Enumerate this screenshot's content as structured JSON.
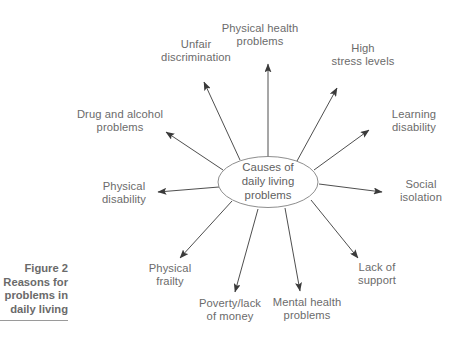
{
  "figure": {
    "caption_lines": [
      "Figure 2",
      "Reasons for",
      "problems in",
      "daily living"
    ],
    "caption_text": "Figure 2 Reasons for problems in daily living"
  },
  "diagram": {
    "center": {
      "label": "Causes of\ndaily living\nproblems"
    },
    "nodes": [
      {
        "id": "physical-health-problems",
        "label": "Physical health\nproblems"
      },
      {
        "id": "high-stress-levels",
        "label": "High\nstress levels"
      },
      {
        "id": "learning-disability",
        "label": "Learning\ndisability"
      },
      {
        "id": "social-isolation",
        "label": "Social\nisolation"
      },
      {
        "id": "lack-of-support",
        "label": "Lack of\nsupport"
      },
      {
        "id": "mental-health-problems",
        "label": "Mental health\nproblems"
      },
      {
        "id": "poverty-lack-of-money",
        "label": "Poverty/lack\nof money"
      },
      {
        "id": "physical-frailty",
        "label": "Physical\nfrailty"
      },
      {
        "id": "physical-disability",
        "label": "Physical\ndisability"
      },
      {
        "id": "drug-and-alcohol-problems",
        "label": "Drug and alcohol\nproblems"
      },
      {
        "id": "unfair-discrimination",
        "label": "Unfair\ndiscrimination"
      }
    ],
    "colors": {
      "text": "#6b6b6b",
      "caption_text": "#6a6a6a",
      "arrow": "#3a3a3a",
      "ellipse_stroke": "#808080",
      "background": "#ffffff",
      "rule": "#9a9a9a"
    }
  }
}
